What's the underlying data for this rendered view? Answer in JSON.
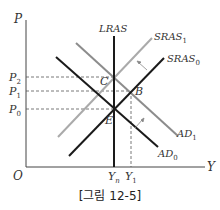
{
  "figure": {
    "caption": "[그림 12-5]",
    "axes": {
      "y_label": "P",
      "x_label": "Y",
      "origin_label": "O"
    },
    "price_levels": [
      {
        "label": "P",
        "sub": "2",
        "y": 77
      },
      {
        "label": "P",
        "sub": "1",
        "y": 91
      },
      {
        "label": "P",
        "sub": "0",
        "y": 109
      }
    ],
    "output_levels": [
      {
        "label": "Y",
        "sub": "n",
        "x": 114
      },
      {
        "label": "Y",
        "sub": "1",
        "x": 131
      }
    ],
    "curves": [
      {
        "name": "LRAS",
        "label": "LRAS",
        "sub": "",
        "color": "#1a1a1a"
      },
      {
        "name": "SRAS1",
        "label": "SRAS",
        "sub": "1",
        "color": "#aaaaaa"
      },
      {
        "name": "SRAS0",
        "label": "SRAS",
        "sub": "0",
        "color": "#1a1a1a"
      },
      {
        "name": "AD1",
        "label": "AD",
        "sub": "1",
        "color": "#8c8c8c"
      },
      {
        "name": "AD0",
        "label": "AD",
        "sub": "0",
        "color": "#1a1a1a"
      }
    ],
    "points": [
      {
        "label": "C",
        "desc": "LRAS, AD1, SRAS1 intersection"
      },
      {
        "label": "B",
        "desc": "AD1, SRAS0 intersection"
      },
      {
        "label": "E",
        "desc": "LRAS, AD0, SRAS0 intersection"
      }
    ],
    "colors": {
      "axis": "#444444",
      "dashed": "#555555",
      "dark_curve": "#1a1a1a",
      "light_curve": "#aaaaaa",
      "mid_curve": "#8c8c8c"
    }
  }
}
